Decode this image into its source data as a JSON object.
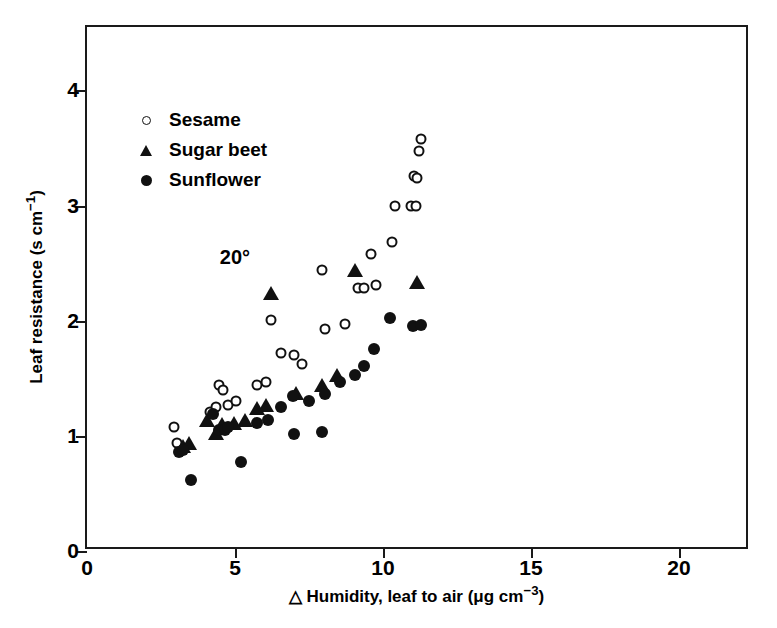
{
  "chart_data": {
    "type": "scatter",
    "title": "",
    "xlabel": "△ Humidity, leaf to air (μg cm−3)",
    "ylabel": "Leaf resistance (s cm−1)",
    "xlabel_parts": {
      "prefix": "△ Humidity, leaf to air (μg cm",
      "exponent": "−3",
      "suffix": ")"
    },
    "ylabel_parts": {
      "prefix": "Leaf resistance (s cm",
      "exponent": "−1",
      "suffix": ")"
    },
    "xlim": [
      0,
      22.4
    ],
    "ylim": [
      0,
      4.55
    ],
    "xticks": [
      0,
      5,
      10,
      15,
      20
    ],
    "yticks": [
      0,
      1,
      2,
      3,
      4
    ],
    "xticklabels": [
      "0",
      "5",
      "10",
      "15",
      "20"
    ],
    "yticklabels": [
      "0",
      "1",
      "2",
      "3",
      "4"
    ],
    "grid": false,
    "legend_position": "upper left inside",
    "annotations": [
      {
        "text": "20°",
        "x": 5.0,
        "y": 2.55
      }
    ],
    "series": [
      {
        "name": "Sesame",
        "marker": "open-circle",
        "color": "#111111",
        "points": [
          [
            2.95,
            1.08
          ],
          [
            3.05,
            0.94
          ],
          [
            4.15,
            1.21
          ],
          [
            4.35,
            1.25
          ],
          [
            4.45,
            1.44
          ],
          [
            4.6,
            1.4
          ],
          [
            4.75,
            1.27
          ],
          [
            5.05,
            1.3
          ],
          [
            5.75,
            1.44
          ],
          [
            6.05,
            1.47
          ],
          [
            6.2,
            2.01
          ],
          [
            6.55,
            1.72
          ],
          [
            7.0,
            1.7
          ],
          [
            7.25,
            1.62
          ],
          [
            7.95,
            2.44
          ],
          [
            8.05,
            1.93
          ],
          [
            8.7,
            1.97
          ],
          [
            9.15,
            2.28
          ],
          [
            9.35,
            2.28
          ],
          [
            9.6,
            2.58
          ],
          [
            9.75,
            2.31
          ],
          [
            10.3,
            2.68
          ],
          [
            10.4,
            3.0
          ],
          [
            10.95,
            3.0
          ],
          [
            11.1,
            3.0
          ],
          [
            11.05,
            3.26
          ],
          [
            11.15,
            3.24
          ],
          [
            11.2,
            3.47
          ],
          [
            11.3,
            3.58
          ]
        ]
      },
      {
        "name": "Sugar beet",
        "marker": "filled-triangle",
        "color": "#111111",
        "points": [
          [
            3.25,
            0.9
          ],
          [
            3.45,
            0.93
          ],
          [
            4.05,
            1.13
          ],
          [
            4.35,
            1.02
          ],
          [
            4.55,
            1.09
          ],
          [
            4.95,
            1.1
          ],
          [
            5.35,
            1.13
          ],
          [
            5.75,
            1.23
          ],
          [
            6.05,
            1.26
          ],
          [
            6.2,
            2.23
          ],
          [
            7.05,
            1.36
          ],
          [
            7.95,
            1.43
          ],
          [
            8.45,
            1.52
          ],
          [
            9.05,
            2.43
          ],
          [
            11.15,
            2.33
          ]
        ]
      },
      {
        "name": "Sunflower",
        "marker": "filled-circle",
        "color": "#111111",
        "points": [
          [
            3.1,
            0.86
          ],
          [
            3.25,
            0.88
          ],
          [
            3.5,
            0.62
          ],
          [
            4.25,
            1.19
          ],
          [
            4.45,
            1.05
          ],
          [
            4.65,
            1.05
          ],
          [
            4.75,
            1.08
          ],
          [
            5.2,
            0.77
          ],
          [
            5.75,
            1.11
          ],
          [
            6.1,
            1.14
          ],
          [
            6.55,
            1.25
          ],
          [
            6.95,
            1.35
          ],
          [
            7.0,
            1.02
          ],
          [
            7.5,
            1.3
          ],
          [
            7.95,
            1.03
          ],
          [
            8.05,
            1.36
          ],
          [
            8.55,
            1.47
          ],
          [
            9.05,
            1.53
          ],
          [
            9.35,
            1.61
          ],
          [
            9.7,
            1.75
          ],
          [
            10.25,
            2.02
          ],
          [
            11.0,
            1.95
          ],
          [
            11.3,
            1.96
          ]
        ]
      }
    ]
  }
}
